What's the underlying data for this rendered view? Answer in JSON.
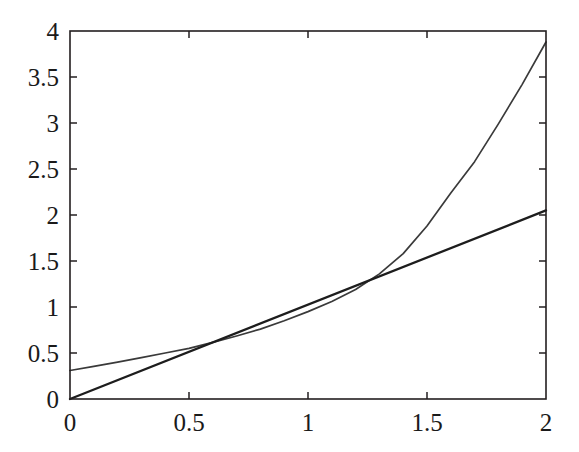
{
  "figure": {
    "background_color": "#ffffff",
    "axes_color": "#231f20",
    "plot_area": {
      "left": 70,
      "top": 31,
      "right": 546,
      "bottom": 399
    }
  },
  "chart_data": {
    "type": "line",
    "title": "",
    "subtitle": "",
    "xlabel": "",
    "ylabel": "",
    "xlim": [
      0,
      2
    ],
    "ylim": [
      0,
      4
    ],
    "grid": false,
    "legend": null,
    "legend_position": "none",
    "box_frame": true,
    "tick_direction": "in",
    "x_ticks": [
      0,
      0.5,
      1,
      1.5,
      2
    ],
    "x_tick_labels": [
      "0",
      "0.5",
      "1",
      "1.5",
      "2"
    ],
    "y_ticks": [
      0,
      0.5,
      1,
      1.5,
      2,
      2.5,
      3,
      3.5,
      4
    ],
    "y_tick_labels": [
      "0",
      "0.5",
      "1",
      "1.5",
      "2",
      "2.5",
      "3",
      "3.5",
      "4"
    ],
    "annotations": [],
    "series": [
      {
        "name": "curve",
        "style": "solid",
        "color": "#3a3a3a",
        "width": 1.7,
        "x": [
          0,
          0.1,
          0.2,
          0.3,
          0.4,
          0.5,
          0.6,
          0.7,
          0.8,
          0.9,
          1.0,
          1.1,
          1.2,
          1.3,
          1.4,
          1.5,
          1.6,
          1.7,
          1.8,
          1.9,
          2.0
        ],
        "values": [
          0.31,
          0.355,
          0.4,
          0.45,
          0.5,
          0.55,
          0.615,
          0.685,
          0.76,
          0.85,
          0.95,
          1.06,
          1.19,
          1.36,
          1.58,
          1.88,
          2.24,
          2.58,
          2.99,
          3.42,
          3.88
        ]
      },
      {
        "name": "straight-line",
        "style": "solid",
        "color": "#1d1d1d",
        "width": 2.3,
        "x": [
          0,
          2
        ],
        "values": [
          0,
          2.05
        ]
      }
    ],
    "intersections": [
      {
        "x": 0.49,
        "y": 0.5
      },
      {
        "x": 1.24,
        "y": 1.27
      }
    ]
  }
}
